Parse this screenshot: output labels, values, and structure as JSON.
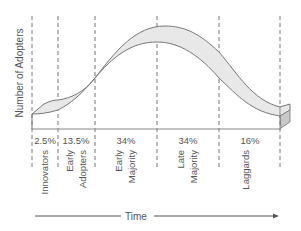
{
  "diagram": {
    "y_axis_label": "Number of Adopters",
    "x_axis_label": "Time",
    "segments": [
      {
        "name": "Innovators",
        "line1": "Innovators",
        "line2": "",
        "percent": "2.5%"
      },
      {
        "name": "Early Adopters",
        "line1": "Early",
        "line2": "Adopters",
        "percent": "13.5%"
      },
      {
        "name": "Early Majority",
        "line1": "Early",
        "line2": "Majority",
        "percent": "34%"
      },
      {
        "name": "Late Majority",
        "line1": "Late",
        "line2": "Majority",
        "percent": "34%"
      },
      {
        "name": "Laggards",
        "line1": "Laggards",
        "line2": "",
        "percent": "16%"
      }
    ],
    "colors": {
      "ribbon_fill": "#e8e8e8",
      "ribbon_stroke": "#777777",
      "box_side": "#c8c8c8",
      "dashed": "#777777",
      "text": "#555555"
    }
  }
}
